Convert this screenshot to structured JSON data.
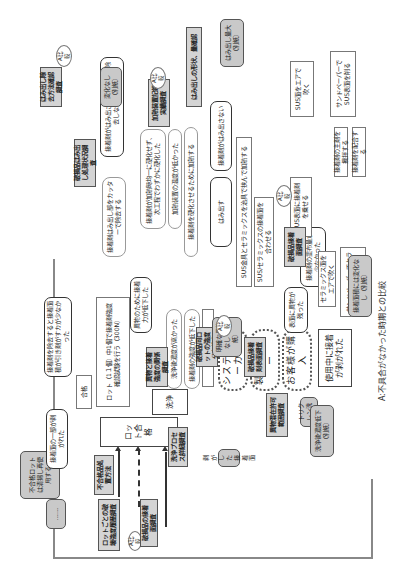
{
  "caption": "A:不具合がなかった時期との比較",
  "process_chain": {
    "lot_pass": "ロット合格",
    "wash": "洗浄",
    "ship": "出荷",
    "pass": "合格",
    "system_maker": "システムメーカー",
    "product_maker": "製品メーカー",
    "customer": "お客様が購入",
    "top_event": "使用中に接着が剥がれた"
  },
  "facts": {
    "part_peeled": "接着面の一部が剥がれた",
    "adhesive_spread_small": "接着剤を除去すると接着面積が引き剤がすカが少なかった",
    "adhesive_not_extruded": "接着剤がはみ出さなかったので除去しなかった",
    "adhesive_not_extruded2": "接着剤がはみ出さない",
    "foreign_matter_low": "異物のために接着力が低下した",
    "surface_foreign": "表面に異物が残った",
    "coating_mismatch": "接着剤の塗布量が少なかった",
    "extrude": "はみ出す"
  },
  "causes": {
    "trim_cutter": "接着剤はみ出し部をカッターで除去する",
    "cure_uneven": "接着剤が加熱時均一に硬化せず、次工程でわずかに硬化した",
    "heat_temp_low": "加熱装置の温度が低かった",
    "cure_not_full": "接着剤を硬化させるために加熱する",
    "jig_clamp": "SUS金具とセラミックスを治具で挟んで加熱する",
    "sus_ceramic_align": "SUS/セラミックスの接着面を合わせる",
    "sus_coat": "SUS表面に接着剤を乗せる",
    "sus_air": "SUS面をエアで吹く",
    "sandpaper_sus": "サンドペーパーでSUS表面を削る",
    "adhesive_mix": "接着剤の主剤を攪拌する",
    "adhesive_blend": "接着剤を配合する",
    "ceramic_air": "セラミックス面をエアで吹く",
    "sandpaper_ceramic": "サンドペーパーでセラミックス表面を削る",
    "lot_test": "ロット（1１個）中1個で接着剤強度確認試験を行う（300N）",
    "wash_speed": "洗浄後濃度が高かった",
    "adhesive_after_wash": "接着剤の強度が低下した"
  },
  "investigations": {
    "extrude_dir": "はみ出し除去方法確認調査",
    "extrude_treat": "破損品はみ出し処理状況調査",
    "heat_record": "加熱装置記録実績調査",
    "extrude_shape": "はみ出しの形状、量確認",
    "broken_adhesive_surface": "破損品接着面調査",
    "broken_surface": "破損品接着剤表面調査",
    "foreign_relation": "異物と接着強度の関係調査",
    "broken_lot_strength": "破損品同ロットの強度分布推定",
    "broken_state": "破損品の接着面調査",
    "lot_strength": "ロットごとの破壊強度履歴調査",
    "defect_method": "不合格品処置方法",
    "wash_process": "洗浄プロセス詳細調査",
    "foreign_allow": "異物混在許可範囲調査"
  },
  "notes": {
    "extrude_big": "はみ出し量大（別紙）",
    "heat_no_change": "変化なし（別紙）",
    "coat_no_change": "接着面積には変化なし（別紙）",
    "no_clear_foreign": "明確な異物なし（別紙）",
    "peeled_surface": "剥がした接着面",
    "reject_reuse": "不合格ロットは清掃し再使用する",
    "trichlor": "トリクレン洗浄…",
    "wash_conc": "洗浄後濃度低下（別紙）",
    "ellipsis": "……"
  },
  "comparison_label": "A比較"
}
